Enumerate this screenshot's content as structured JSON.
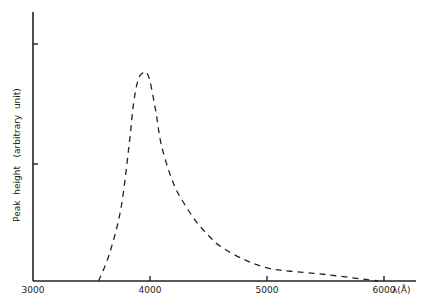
{
  "chart_data": {
    "type": "line",
    "title": "",
    "xlabel": "λ(Å)",
    "ylabel": "Peak  height   (arbitrary  unit)",
    "xlim": [
      3000,
      6300
    ],
    "ylim": [
      0,
      1.15
    ],
    "x_ticks": [
      "3000",
      "4000",
      "5000",
      "6000"
    ],
    "y_ticks_labeled": false,
    "grid": false,
    "series": [
      {
        "name": "peak height",
        "style": "dashed",
        "x": [
          3560,
          3650,
          3750,
          3820,
          3860,
          3900,
          3940,
          3970,
          4000,
          4050,
          4100,
          4200,
          4300,
          4400,
          4500,
          4600,
          4800,
          5000,
          5200,
          5500,
          5800,
          5950
        ],
        "y": [
          0.0,
          0.12,
          0.33,
          0.62,
          0.82,
          0.93,
          0.96,
          0.96,
          0.92,
          0.78,
          0.62,
          0.45,
          0.35,
          0.27,
          0.21,
          0.16,
          0.1,
          0.06,
          0.045,
          0.03,
          0.01,
          0.0
        ]
      }
    ]
  }
}
